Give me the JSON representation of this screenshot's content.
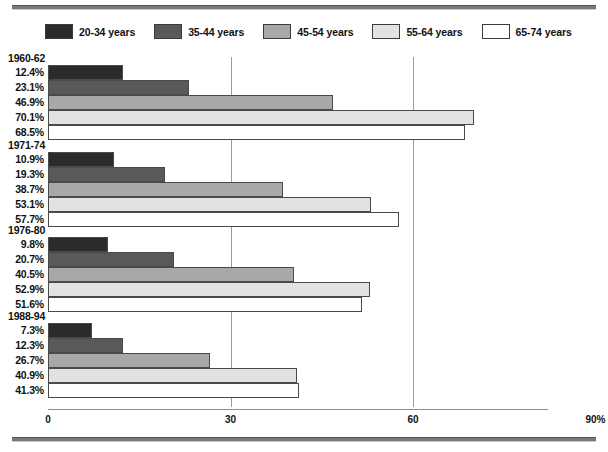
{
  "chart_data": {
    "type": "bar",
    "orientation": "horizontal",
    "title": "",
    "xlabel": "",
    "ylabel": "",
    "xlim": [
      0,
      90
    ],
    "xticks": [
      "0",
      "30",
      "60",
      "90%"
    ],
    "xtick_values": [
      0,
      30,
      60,
      90
    ],
    "grid": true,
    "gridlines_at": [
      30,
      60
    ],
    "legend_position": "top-left",
    "value_suffix": "%",
    "series": [
      {
        "name": "20-34 years",
        "color": "#2b2b2b",
        "values": [
          12.4,
          10.9,
          9.8,
          7.3
        ]
      },
      {
        "name": "35-44 years",
        "color": "#595959",
        "values": [
          23.1,
          19.3,
          20.7,
          12.3
        ]
      },
      {
        "name": "45-54 years",
        "color": "#a8a8a8",
        "values": [
          46.9,
          38.7,
          40.5,
          26.7
        ]
      },
      {
        "name": "55-64 years",
        "color": "#e2e2e2",
        "values": [
          70.1,
          53.1,
          52.9,
          40.9
        ]
      },
      {
        "name": "65-74 years",
        "color": "#ffffff",
        "values": [
          68.5,
          57.7,
          51.6,
          41.3
        ]
      }
    ],
    "categories": [
      "1960-62",
      "1971-74",
      "1976-80",
      "1988-94"
    ],
    "groups": [
      {
        "label": "1960-62",
        "bars": [
          {
            "series": "20-34 years",
            "value": 12.4,
            "value_label": "12.4%",
            "color": "#2b2b2b"
          },
          {
            "series": "35-44 years",
            "value": 23.1,
            "value_label": "23.1%",
            "color": "#595959"
          },
          {
            "series": "45-54 years",
            "value": 46.9,
            "value_label": "46.9%",
            "color": "#a8a8a8"
          },
          {
            "series": "55-64 years",
            "value": 70.1,
            "value_label": "70.1%",
            "color": "#e2e2e2"
          },
          {
            "series": "65-74 years",
            "value": 68.5,
            "value_label": "68.5%",
            "color": "#ffffff"
          }
        ]
      },
      {
        "label": "1971-74",
        "bars": [
          {
            "series": "20-34 years",
            "value": 10.9,
            "value_label": "10.9%",
            "color": "#2b2b2b"
          },
          {
            "series": "35-44 years",
            "value": 19.3,
            "value_label": "19.3%",
            "color": "#595959"
          },
          {
            "series": "45-54 years",
            "value": 38.7,
            "value_label": "38.7%",
            "color": "#a8a8a8"
          },
          {
            "series": "55-64 years",
            "value": 53.1,
            "value_label": "53.1%",
            "color": "#e2e2e2"
          },
          {
            "series": "65-74 years",
            "value": 57.7,
            "value_label": "57.7%",
            "color": "#ffffff"
          }
        ]
      },
      {
        "label": "1976-80",
        "bars": [
          {
            "series": "20-34 years",
            "value": 9.8,
            "value_label": "9.8%",
            "color": "#2b2b2b"
          },
          {
            "series": "35-44 years",
            "value": 20.7,
            "value_label": "20.7%",
            "color": "#595959"
          },
          {
            "series": "45-54 years",
            "value": 40.5,
            "value_label": "40.5%",
            "color": "#a8a8a8"
          },
          {
            "series": "55-64 years",
            "value": 52.9,
            "value_label": "52.9%",
            "color": "#e2e2e2"
          },
          {
            "series": "65-74 years",
            "value": 51.6,
            "value_label": "51.6%",
            "color": "#ffffff"
          }
        ]
      },
      {
        "label": "1988-94",
        "bars": [
          {
            "series": "20-34 years",
            "value": 7.3,
            "value_label": "7.3%",
            "color": "#2b2b2b"
          },
          {
            "series": "35-44 years",
            "value": 12.3,
            "value_label": "12.3%",
            "color": "#595959"
          },
          {
            "series": "45-54 years",
            "value": 26.7,
            "value_label": "26.7%",
            "color": "#a8a8a8"
          },
          {
            "series": "55-64 years",
            "value": 40.9,
            "value_label": "40.9%",
            "color": "#e2e2e2"
          },
          {
            "series": "65-74 years",
            "value": 41.3,
            "value_label": "41.3%",
            "color": "#ffffff"
          }
        ]
      }
    ]
  },
  "legend": {
    "items": [
      {
        "label": "20-34 years",
        "color": "#2b2b2b"
      },
      {
        "label": "35-44 years",
        "color": "#595959"
      },
      {
        "label": "45-54 years",
        "color": "#a8a8a8"
      },
      {
        "label": "55-64 years",
        "color": "#e2e2e2"
      },
      {
        "label": "65-74 years",
        "color": "#ffffff"
      }
    ]
  }
}
